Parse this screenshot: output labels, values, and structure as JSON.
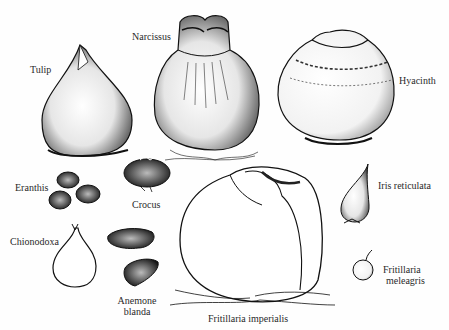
{
  "figure": {
    "bulbs": [
      {
        "id": "tulip",
        "label": "Tulip"
      },
      {
        "id": "narcissus",
        "label": "Narcissus"
      },
      {
        "id": "hyacinth",
        "label": "Hyacinth"
      },
      {
        "id": "eranthis",
        "label": "Eranthis"
      },
      {
        "id": "crocus",
        "label": "Crocus"
      },
      {
        "id": "iris",
        "label": "Iris reticulata"
      },
      {
        "id": "chionodoxa",
        "label": "Chionodoxa"
      },
      {
        "id": "anemone",
        "label_line1": "Anemone",
        "label_line2": "blanda"
      },
      {
        "id": "fritillaria-imperialis",
        "label": "Fritillaria  imperialis"
      },
      {
        "id": "fritillaria-meleagris",
        "label_line1": "Fritillaria",
        "label_line2": "meleagris"
      }
    ],
    "colors": {
      "ink": "#1a1a1a",
      "paper": "#fefefe"
    }
  }
}
